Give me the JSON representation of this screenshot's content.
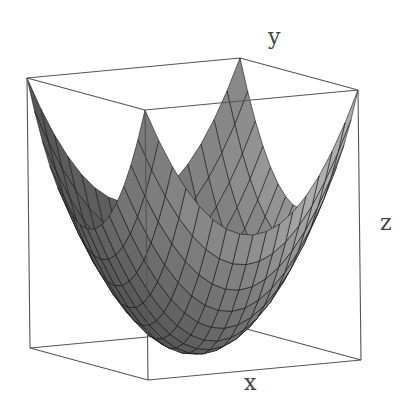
{
  "chart_data": {
    "type": "surface3d",
    "title": "",
    "function": "z = x^2 + y^2",
    "xlabel": "x",
    "ylabel": "y",
    "zlabel": "z",
    "xlim": [
      -1,
      1
    ],
    "ylim": [
      -1,
      1
    ],
    "zlim": [
      0,
      2
    ],
    "grid_resolution": 16,
    "box": true,
    "ticks": false,
    "shading": "grayscale",
    "colors": {
      "box_line": "#555555",
      "mesh_line": "#1a1a1a",
      "surface_light": "#b8b8b8",
      "surface_dark": "#1e1e1e",
      "label": "#444444",
      "background": "#ffffff"
    }
  },
  "labels": {
    "x": "x",
    "y": "y",
    "z": "z"
  }
}
